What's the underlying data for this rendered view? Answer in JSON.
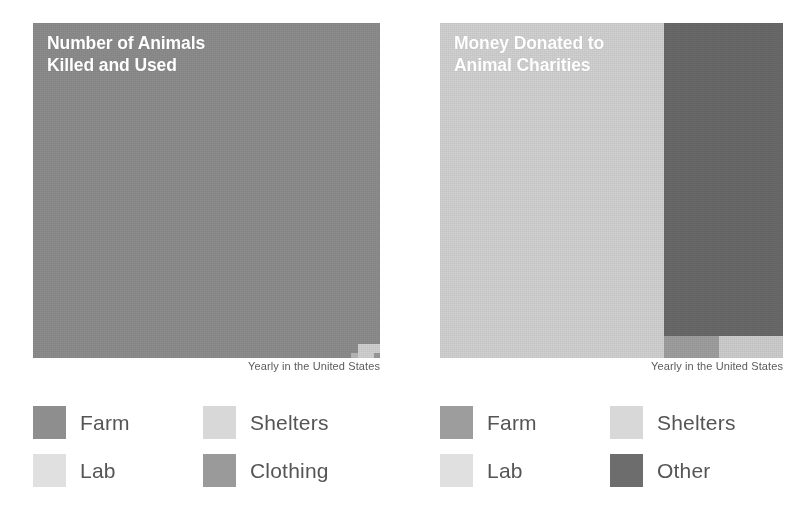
{
  "chart_data": [
    {
      "type": "treemap",
      "title": "Number of Animals\nKilled and Used",
      "caption": "Yearly in the United States",
      "xlabel": "",
      "ylabel": "",
      "legend_position": "bottom",
      "categories": [
        "Farm",
        "Lab",
        "Shelters",
        "Clothing"
      ],
      "values": [
        99.2,
        0.3,
        0.4,
        0.1
      ],
      "unit": "percent of total animals",
      "segments": [
        {
          "name": "Farm",
          "color": "#8e8e8e",
          "x": 0,
          "y": 0,
          "w": 347,
          "h": 335
        },
        {
          "name": "Shelters",
          "color": "#d2d2d2",
          "x": 325,
          "y": 321,
          "w": 22,
          "h": 14
        },
        {
          "name": "Lab",
          "color": "#b9b9b9",
          "x": 318,
          "y": 330,
          "w": 7,
          "h": 5
        },
        {
          "name": "Clothing",
          "color": "#9b9b9b",
          "x": 341,
          "y": 330,
          "w": 6,
          "h": 5
        }
      ],
      "legend": [
        {
          "label": "Farm",
          "color": "#8e8e8e"
        },
        {
          "label": "Shelters",
          "color": "#d8d8d8"
        },
        {
          "label": "Lab",
          "color": "#e0e0e0"
        },
        {
          "label": "Clothing",
          "color": "#9a9a9a"
        }
      ]
    },
    {
      "type": "treemap",
      "title": "Money Donated to\nAnimal Charities",
      "caption": "Yearly in the United States",
      "xlabel": "",
      "ylabel": "",
      "legend_position": "bottom",
      "categories": [
        "Shelters",
        "Other",
        "Farm",
        "Lab"
      ],
      "values": [
        65.0,
        29.0,
        4.5,
        1.5
      ],
      "unit": "percent of donations",
      "segments": [
        {
          "name": "Shelters",
          "color": "#d3d3d3",
          "x": 0,
          "y": 0,
          "w": 224,
          "h": 335
        },
        {
          "name": "Other",
          "color": "#6a6a6a",
          "x": 224,
          "y": 0,
          "w": 119,
          "h": 313
        },
        {
          "name": "Farm",
          "color": "#a0a0a0",
          "x": 224,
          "y": 313,
          "w": 55,
          "h": 22
        },
        {
          "name": "Lab",
          "color": "#cfcfcf",
          "x": 279,
          "y": 313,
          "w": 64,
          "h": 22
        }
      ],
      "legend": [
        {
          "label": "Farm",
          "color": "#9d9d9d"
        },
        {
          "label": "Shelters",
          "color": "#d8d8d8"
        },
        {
          "label": "Lab",
          "color": "#e0e0e0"
        },
        {
          "label": "Other",
          "color": "#6d6d6d"
        }
      ]
    }
  ],
  "colors": {
    "background": "#ffffff",
    "title_text": "#ffffff",
    "caption_text": "#5b5b5b",
    "legend_text": "#555555"
  }
}
